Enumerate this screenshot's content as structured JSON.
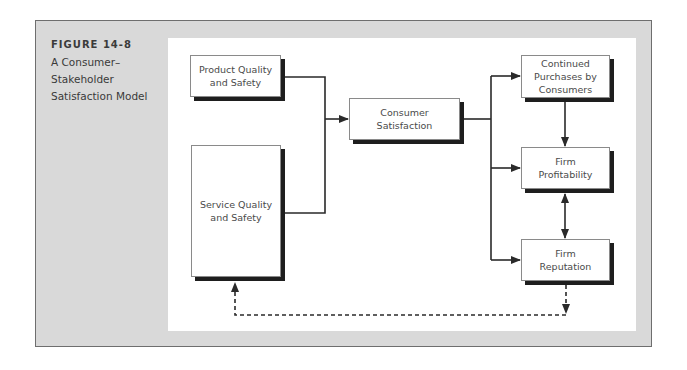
{
  "figure": {
    "number": "FIGURE 14-8",
    "title": "A Consumer–\nStakeholder\nSatisfaction Model",
    "title_lines": [
      "A Consumer–",
      "Stakeholder",
      "Satisfaction Model"
    ]
  },
  "diagram": {
    "nodes": {
      "product_quality": {
        "label": "Product Quality\nand Safety"
      },
      "service_quality": {
        "label": "Service Quality\nand Safety"
      },
      "consumer_satisfaction": {
        "label": "Consumer\nSatisfaction"
      },
      "continued_purchases": {
        "label": "Continued\nPurchases by\nConsumers"
      },
      "firm_profitability": {
        "label": "Firm\nProfitability"
      },
      "firm_reputation": {
        "label": "Firm\nReputation"
      }
    },
    "edges": [
      {
        "from": "product_quality",
        "to": "consumer_satisfaction",
        "style": "solid"
      },
      {
        "from": "service_quality",
        "to": "consumer_satisfaction",
        "style": "solid"
      },
      {
        "from": "consumer_satisfaction",
        "to": "continued_purchases",
        "style": "solid"
      },
      {
        "from": "consumer_satisfaction",
        "to": "firm_profitability",
        "style": "solid"
      },
      {
        "from": "consumer_satisfaction",
        "to": "firm_reputation",
        "style": "solid"
      },
      {
        "from": "continued_purchases",
        "to": "firm_profitability",
        "style": "solid"
      },
      {
        "from": "firm_profitability",
        "to": "firm_reputation",
        "style": "solid",
        "bidirectional": true
      },
      {
        "from": "firm_reputation",
        "to": "service_quality",
        "style": "dashed"
      }
    ]
  },
  "colors": {
    "frame_bg": "#d9d9d9",
    "panel_bg": "#ffffff",
    "line": "#2a2a2a",
    "shadow": "#1e1e1e",
    "text": "#4a4a4a"
  }
}
